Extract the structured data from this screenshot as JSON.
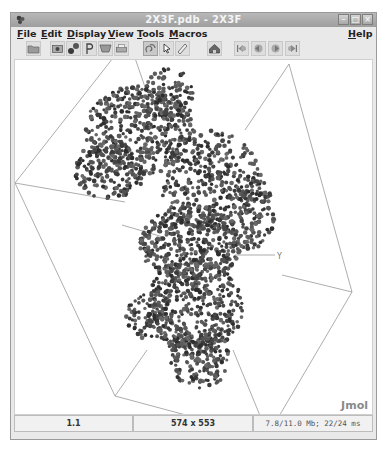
{
  "window": {
    "title": "2X3F.pdb - 2X3F",
    "app_icon": "jmol-app-icon",
    "controls": [
      {
        "name": "minimize",
        "glyph": "–"
      },
      {
        "name": "maximize",
        "glyph": "□"
      },
      {
        "name": "close",
        "glyph": "×"
      }
    ]
  },
  "menubar": {
    "items": [
      {
        "label": "File",
        "mnemonic": "F",
        "rest": "ile"
      },
      {
        "label": "Edit",
        "mnemonic": "E",
        "rest": "dit"
      },
      {
        "label": "Display",
        "mnemonic": "D",
        "rest": "isplay"
      },
      {
        "label": "View",
        "mnemonic": "V",
        "rest": "iew"
      },
      {
        "label": "Tools",
        "mnemonic": "T",
        "rest": "ools"
      },
      {
        "label": "Macros",
        "mnemonic": "M",
        "rest": "acros"
      }
    ],
    "help": {
      "label": "Help",
      "mnemonic": "H",
      "rest": "elp"
    }
  },
  "toolbar": {
    "buttons": [
      {
        "name": "open-file",
        "icon": "folder-icon"
      },
      {
        "name": "export-image",
        "icon": "camera-icon"
      },
      {
        "name": "edit-script",
        "icon": "molecule-icon"
      },
      {
        "name": "console",
        "icon": "console-icon"
      },
      {
        "name": "script-editor",
        "icon": "editor-icon"
      },
      {
        "name": "print",
        "icon": "printer-icon"
      },
      {
        "name": "rotate",
        "icon": "rotate-icon",
        "active": true
      },
      {
        "name": "pick",
        "icon": "pointer-icon"
      },
      {
        "name": "measure",
        "icon": "ruler-icon"
      },
      {
        "name": "home",
        "icon": "home-icon"
      },
      {
        "name": "first-frame",
        "icon": "first-frame-icon"
      },
      {
        "name": "previous-frame",
        "icon": "prev-frame-icon"
      },
      {
        "name": "next-frame",
        "icon": "next-frame-icon"
      },
      {
        "name": "last-frame",
        "icon": "last-frame-icon"
      }
    ]
  },
  "viewport": {
    "axis_label": "Y",
    "logo": "Jmol",
    "background": "#ffffff",
    "atom_color": "#4a4a4a",
    "unitcell_color": "#7a7a7a"
  },
  "statusbar": {
    "frame": "1.1",
    "size": "574 x 553",
    "memory": "7.8/11.0 Mb;  22/24 ms"
  }
}
